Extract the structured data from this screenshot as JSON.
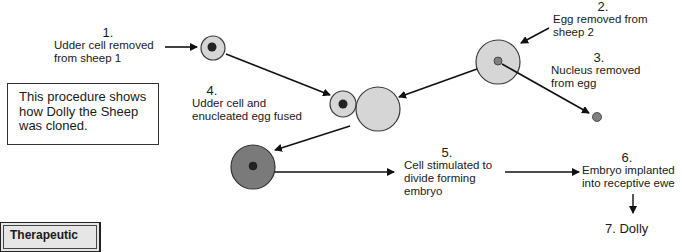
{
  "diagram": {
    "title_box": {
      "lines": [
        "This procedure shows",
        "how Dolly the Sheep",
        "was cloned."
      ]
    },
    "steps": [
      {
        "number": "1.",
        "lines": [
          "Udder cell removed",
          "from sheep 1"
        ]
      },
      {
        "number": "2.",
        "lines": [
          "Egg removed from",
          "sheep 2"
        ]
      },
      {
        "number": "3.",
        "lines": [
          "Nucleus removed",
          "from egg"
        ]
      },
      {
        "number": "4.",
        "lines": [
          "Udder cell and",
          "enucleated egg fused"
        ]
      },
      {
        "number": "5.",
        "lines": [
          "Cell stimulated to",
          "divide forming",
          "embryo"
        ]
      },
      {
        "number": "6.",
        "lines": [
          "Embryo implanted",
          "into receptive ewe"
        ]
      },
      {
        "number": "7.",
        "label": "7. Dolly"
      }
    ],
    "footer_box": {
      "label": "Therapeutic"
    },
    "colors": {
      "cell_fill": "#d6d6d6",
      "cell_stroke": "#3a3a3a",
      "nucleus_dark": "#222222",
      "nucleus_gray": "#808080",
      "embryo_fill": "#7a7a7a",
      "arrow": "#111111"
    }
  }
}
